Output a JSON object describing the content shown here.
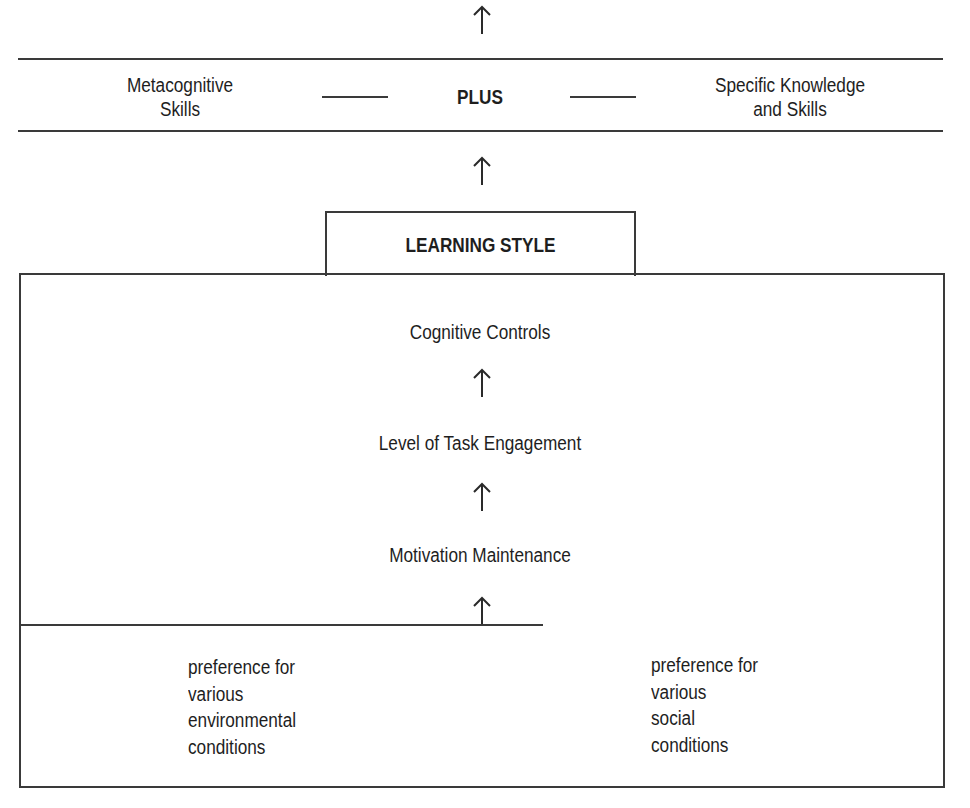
{
  "diagram": {
    "top_band": {
      "left_label": [
        "Metacognitive",
        "Skills"
      ],
      "center_label": "PLUS",
      "right_label": [
        "Specific Knowledge",
        "and Skills"
      ]
    },
    "learning_style_title": "LEARNING STYLE",
    "inner_stack": [
      "Cognitive Controls",
      "Level of Task Engagement",
      "Motivation Maintenance"
    ],
    "preferences": {
      "left": [
        "preference for",
        "various",
        "environmental",
        "conditions"
      ],
      "right": [
        "preference for",
        "various",
        "social",
        "conditions"
      ]
    },
    "arrows": [
      "up-arrow-top",
      "up-arrow-to-plus-band",
      "up-arrow-to-cognitive-controls",
      "up-arrow-to-task-engagement",
      "up-arrow-to-motivation"
    ],
    "colors": {
      "line": "#3a3a3a",
      "text": "#1e1e1e",
      "background": "#ffffff"
    }
  }
}
